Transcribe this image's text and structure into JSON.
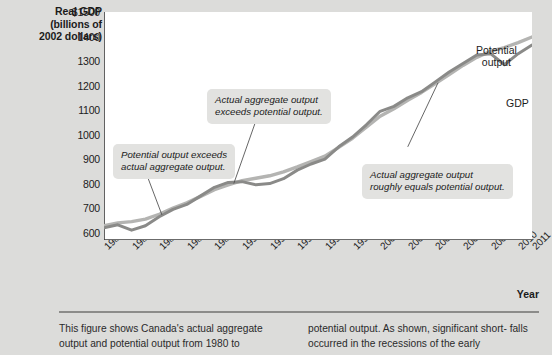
{
  "axis": {
    "y_title_lines": [
      "Real GDP",
      "(billions of",
      "2002 dollars)"
    ],
    "y_ticks": [
      "$1500",
      "1400",
      "1300",
      "1200",
      "1100",
      "1000",
      "900",
      "800",
      "700",
      "600"
    ],
    "x_title": "Year",
    "x_ticks": [
      "1980",
      "1982",
      "1984",
      "1986",
      "1988",
      "1990",
      "1992",
      "1994",
      "1996",
      "1998",
      "2000",
      "2002",
      "2004",
      "2006",
      "2008",
      "2010",
      "2011"
    ]
  },
  "callouts": [
    {
      "line1": "Potential output exceeds",
      "line2": "actual aggregate output."
    },
    {
      "line1": "Actual aggregate output",
      "line2": "exceeds potential output."
    },
    {
      "line1": "Actual aggregate output",
      "line2": "roughly equals potential output."
    }
  ],
  "series_labels": {
    "potential_line1": "Potential",
    "potential_line2": "output",
    "gdp": "GDP"
  },
  "caption": {
    "col1_line1": "This figure shows Canada's actual aggregate",
    "col1_line2": "output and potential output from 1980 to",
    "col2_line1": "potential output. As shown, significant short-",
    "col2_line2": "falls occurred in the recessions of the early"
  },
  "colors": {
    "background": "#dcdcda",
    "plot_background": "#ffffff",
    "gdp_line": "#8a8a88",
    "potential_line": "#b4b4b2",
    "axis": "#3a3a3a",
    "callout_background": "#e2e2e0"
  },
  "chart_data": {
    "type": "line",
    "title": "",
    "xlabel": "Year",
    "ylabel": "Real GDP (billions of 2002 dollars)",
    "xlim": [
      1980,
      2011
    ],
    "ylim": [
      570,
      1500
    ],
    "ytick_values": [
      1500,
      1400,
      1300,
      1200,
      1100,
      1000,
      900,
      800,
      700,
      600
    ],
    "axis_break_below": 600,
    "grid": false,
    "legend": "inline-labels",
    "x": [
      1980,
      1981,
      1982,
      1983,
      1984,
      1985,
      1986,
      1987,
      1988,
      1989,
      1990,
      1991,
      1992,
      1993,
      1994,
      1995,
      1996,
      1997,
      1998,
      1999,
      2000,
      2001,
      2002,
      2003,
      2004,
      2005,
      2006,
      2007,
      2008,
      2009,
      2010,
      2011
    ],
    "series": [
      {
        "name": "GDP",
        "values": [
          620,
          632,
          610,
          628,
          665,
          695,
          715,
          750,
          785,
          805,
          808,
          795,
          800,
          820,
          855,
          880,
          900,
          950,
          990,
          1040,
          1095,
          1115,
          1150,
          1175,
          1215,
          1255,
          1290,
          1325,
          1330,
          1285,
          1330,
          1365
        ]
      },
      {
        "name": "Potential output",
        "values": [
          628,
          640,
          645,
          655,
          675,
          700,
          722,
          748,
          775,
          795,
          812,
          822,
          832,
          848,
          868,
          890,
          912,
          948,
          985,
          1030,
          1075,
          1105,
          1140,
          1172,
          1208,
          1245,
          1282,
          1315,
          1340,
          1355,
          1375,
          1398
        ]
      }
    ],
    "annotations": [
      {
        "text": "Potential output exceeds actual aggregate output.",
        "points_to_year": 1984
      },
      {
        "text": "Actual aggregate output exceeds potential output.",
        "points_to_year": 1989
      },
      {
        "text": "Actual aggregate output roughly equals potential output.",
        "points_to_year": 2004
      }
    ]
  }
}
